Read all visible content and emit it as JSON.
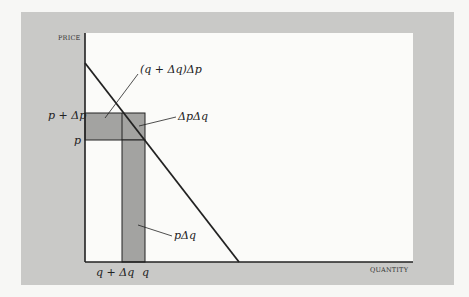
{
  "diagram": {
    "axes": {
      "y_label": "PRICE",
      "x_label": "QUANTITY"
    },
    "tick_labels": {
      "y_upper": "p + Δp",
      "y_lower": "p",
      "x_left": "q + Δq",
      "x_right": "q"
    },
    "annotations": {
      "upper_rect": "(q + Δq)Δp",
      "corner_rect": "ΔpΔq",
      "lower_rect": "pΔq"
    },
    "colors": {
      "frame": "#c9c9c7",
      "plot_background": "#fbfbf9",
      "shaded_region": "#a3a3a1",
      "line": "#222222"
    }
  }
}
